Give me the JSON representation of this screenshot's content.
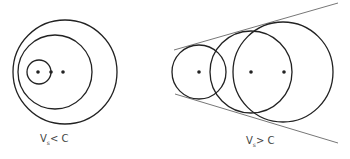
{
  "diagrams": [
    {
      "name": "subsonic",
      "label_main": "V",
      "label_sub": "s",
      "label_rel": "< C",
      "circles": [
        {
          "cx": 65,
          "cy": 72,
          "r": 52
        },
        {
          "cx": 55,
          "cy": 72,
          "r": 37
        },
        {
          "cx": 39,
          "cy": 72,
          "r": 12
        }
      ],
      "dots": [
        {
          "cx": 38,
          "cy": 72
        },
        {
          "cx": 51,
          "cy": 72
        },
        {
          "cx": 63,
          "cy": 72
        }
      ]
    },
    {
      "name": "supersonic",
      "label_main": "V",
      "label_sub": "s",
      "label_rel": "> C",
      "circles": [
        {
          "cx": 199,
          "cy": 72,
          "r": 27
        },
        {
          "cx": 251,
          "cy": 72,
          "r": 41
        },
        {
          "cx": 283,
          "cy": 72,
          "r": 50
        }
      ],
      "dots": [
        {
          "cx": 199,
          "cy": 72
        },
        {
          "cx": 251,
          "cy": 72
        },
        {
          "cx": 284,
          "cy": 72
        }
      ],
      "lines": [
        {
          "x1": 174,
          "y1": 50,
          "x2": 338,
          "y2": 3
        },
        {
          "x1": 175,
          "y1": 94,
          "x2": 338,
          "y2": 143
        }
      ]
    }
  ],
  "colors": {
    "stroke": "#222222",
    "line": "#777777"
  }
}
